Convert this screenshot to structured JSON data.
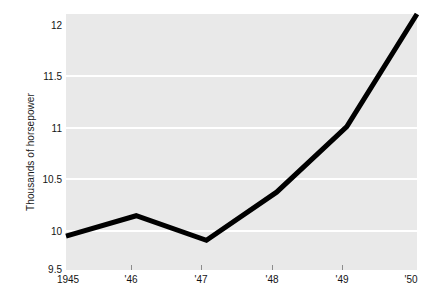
{
  "chart_data": {
    "type": "line",
    "title": "",
    "xlabel": "",
    "ylabel": "Thousands of horsepower",
    "x": [
      1945,
      1946,
      1947,
      1948,
      1949,
      1950
    ],
    "x_tick_labels": [
      "1945",
      "'46",
      "'47",
      "'48",
      "'49",
      "'50"
    ],
    "values": [
      9.83,
      10.03,
      9.79,
      10.26,
      10.9,
      12.0
    ],
    "series": [
      {
        "name": "Thousands of horsepower",
        "values": [
          9.83,
          10.03,
          9.79,
          10.26,
          10.9,
          12.0
        ]
      }
    ],
    "ylim": [
      9.5,
      12.0
    ],
    "xlim": [
      1945,
      1950
    ],
    "y_ticks": [
      12,
      11.5,
      11,
      10.5,
      10,
      9.5
    ],
    "y_tick_labels": [
      "12",
      "11.5",
      "11",
      "10.5",
      "10",
      "9.5"
    ],
    "grid": true,
    "grid_axis": "y",
    "legend": "none",
    "line_color": "#000000",
    "line_width": 5,
    "plot_background": "#e9e9e9",
    "gridline_color": "#ffffff",
    "figure_background": "#ffffff"
  }
}
